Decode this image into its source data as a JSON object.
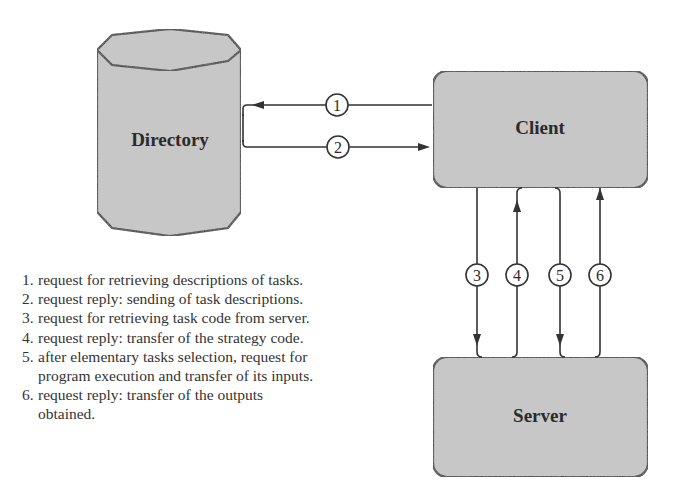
{
  "diagram": {
    "nodes": {
      "directory": {
        "label": "Directory",
        "shape": "cylinder"
      },
      "client": {
        "label": "Client",
        "shape": "rounded-rectangle"
      },
      "server": {
        "label": "Server",
        "shape": "rounded-rectangle"
      }
    },
    "edges": [
      {
        "step": "1",
        "from": "Client",
        "to": "Directory"
      },
      {
        "step": "2",
        "from": "Directory",
        "to": "Client"
      },
      {
        "step": "3",
        "from": "Client",
        "to": "Server"
      },
      {
        "step": "4",
        "from": "Server",
        "to": "Client"
      },
      {
        "step": "5",
        "from": "Client",
        "to": "Server"
      },
      {
        "step": "6",
        "from": "Server",
        "to": "Client"
      }
    ],
    "colors": {
      "node_fill": "#c8c8c8",
      "stroke": "#333333",
      "text": "#2b2b2b",
      "background": "#ffffff"
    }
  },
  "legend": {
    "items": [
      {
        "num": "1.",
        "text": "request for retrieving descriptions of tasks."
      },
      {
        "num": "2.",
        "text": "request reply: sending of task descriptions."
      },
      {
        "num": "3.",
        "text": "request for retrieving task code from server."
      },
      {
        "num": "4.",
        "text": "request reply: transfer of the strategy code."
      },
      {
        "num": "5.",
        "text": "after elementary tasks selection, request for program execution and transfer of its inputs."
      },
      {
        "num": "6.",
        "text": "request reply: transfer of the outputs obtained."
      }
    ]
  }
}
